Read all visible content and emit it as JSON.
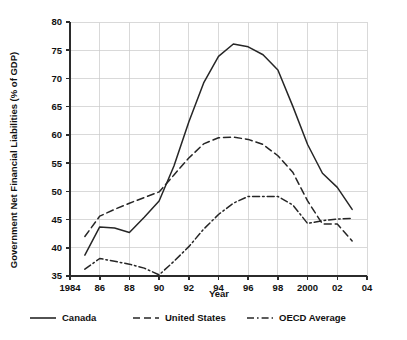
{
  "chart_data": {
    "type": "line",
    "title": "",
    "xlabel": "Year",
    "ylabel": "Government Net Financial Liabilities (% of GDP)",
    "xlim": [
      1984,
      2004
    ],
    "ylim": [
      35,
      80
    ],
    "grid": true,
    "legend_position": "bottom",
    "x_tick_labels": [
      "1984",
      "86",
      "88",
      "90",
      "92",
      "94",
      "96",
      "98",
      "2000",
      "02",
      "04"
    ],
    "x_ticks": [
      1984,
      1986,
      1988,
      1990,
      1992,
      1994,
      1996,
      1998,
      2000,
      2002,
      2004
    ],
    "y_tick_labels": [
      "35",
      "40",
      "45",
      "50",
      "55",
      "60",
      "65",
      "70",
      "75",
      "80"
    ],
    "y_ticks": [
      35,
      40,
      45,
      50,
      55,
      60,
      65,
      70,
      75,
      80
    ],
    "x": [
      1985,
      1986,
      1987,
      1988,
      1989,
      1990,
      1991,
      1992,
      1993,
      1994,
      1995,
      1996,
      1997,
      1998,
      1999,
      2000,
      2001,
      2002,
      2003
    ],
    "series": [
      {
        "name": "Canada",
        "style": "solid",
        "color": "#262626",
        "values": [
          38.7,
          43.7,
          43.5,
          42.7,
          45.4,
          48.3,
          54.5,
          62.3,
          69.2,
          73.9,
          76.1,
          75.6,
          74.2,
          71.5,
          65.1,
          58.3,
          53.2,
          50.7,
          46.8
        ]
      },
      {
        "name": "United States",
        "style": "dashed",
        "color": "#262626",
        "values": [
          42.0,
          45.6,
          46.8,
          47.9,
          48.9,
          49.9,
          52.9,
          55.9,
          58.4,
          59.5,
          59.6,
          59.2,
          58.3,
          56.3,
          53.4,
          48.3,
          44.2,
          44.2,
          41.2
        ]
      },
      {
        "name": "OECD Average",
        "style": "dashdot",
        "color": "#262626",
        "values": [
          36.2,
          38.1,
          37.6,
          37.1,
          36.4,
          35.2,
          37.6,
          40.2,
          43.3,
          45.9,
          47.9,
          49.1,
          49.1,
          49.1,
          47.6,
          44.3,
          44.8,
          45.1,
          45.2
        ]
      }
    ]
  },
  "legend": {
    "items": [
      {
        "label": "Canada",
        "style": "solid"
      },
      {
        "label": "United States",
        "style": "dashed"
      },
      {
        "label": "OECD Average",
        "style": "dashdot"
      }
    ]
  },
  "axes": {
    "x_title": "Year",
    "y_title": "Government Net Financial Liabilities (% of GDP)"
  }
}
